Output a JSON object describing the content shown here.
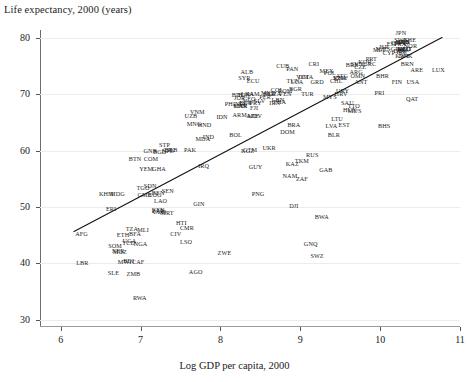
{
  "chart_data": {
    "type": "scatter",
    "title": "Life expectancy, 2000 (years)",
    "xlabel": "Log GDP per capita, 2000",
    "ylabel": "Life expectancy, 2000 (years)",
    "xlim": [
      5.74,
      11.0
    ],
    "ylim": [
      28.9,
      81.4
    ],
    "xticks": [
      6,
      7,
      8,
      9,
      10,
      11
    ],
    "yticks": [
      30,
      40,
      50,
      60,
      70,
      80
    ],
    "xtick_labels": [
      "6",
      "7",
      "8",
      "9",
      "10",
      "11"
    ],
    "ytick_labels": [
      "30",
      "40",
      "50",
      "60",
      "70",
      "80"
    ],
    "grid": "horizontal",
    "legend": null,
    "marker_style": "text-label",
    "fit_line": {
      "type": "linear",
      "x_start": 6.16,
      "y_start": 45.6,
      "x_end": 10.78,
      "y_end": 80.1,
      "slope": 7.47,
      "intercept": -0.41
    },
    "points": [
      {
        "code": "AFG",
        "x": 6.26,
        "y": 45.3
      },
      {
        "code": "AGO",
        "x": 7.69,
        "y": 38.4
      },
      {
        "code": "ALB",
        "x": 8.33,
        "y": 73.9
      },
      {
        "code": "ANT",
        "x": 9.76,
        "y": 72.1
      },
      {
        "code": "ARE",
        "x": 10.46,
        "y": 74.3
      },
      {
        "code": "ARG",
        "x": 9.7,
        "y": 73.9
      },
      {
        "code": "ARM",
        "x": 8.24,
        "y": 66.4
      },
      {
        "code": "ATG",
        "x": 9.52,
        "y": 73.3
      },
      {
        "code": "AUS",
        "x": 10.29,
        "y": 79.2
      },
      {
        "code": "AUT",
        "x": 10.32,
        "y": 78.1
      },
      {
        "code": "AZE",
        "x": 8.4,
        "y": 66.2
      },
      {
        "code": "BDI",
        "x": 6.85,
        "y": 40.4
      },
      {
        "code": "BEL",
        "x": 10.29,
        "y": 77.8
      },
      {
        "code": "BEN",
        "x": 7.22,
        "y": 52.5
      },
      {
        "code": "BFA",
        "x": 6.93,
        "y": 45.2
      },
      {
        "code": "BGD",
        "x": 7.24,
        "y": 59.8
      },
      {
        "code": "BGR",
        "x": 8.94,
        "y": 71.0
      },
      {
        "code": "BHR",
        "x": 10.03,
        "y": 73.2
      },
      {
        "code": "BHS",
        "x": 10.05,
        "y": 64.3
      },
      {
        "code": "BIH",
        "x": 8.21,
        "y": 69.9
      },
      {
        "code": "BLR",
        "x": 9.42,
        "y": 62.7
      },
      {
        "code": "BLZ",
        "x": 8.61,
        "y": 70.0
      },
      {
        "code": "BOL",
        "x": 8.19,
        "y": 62.7
      },
      {
        "code": "BRA",
        "x": 8.92,
        "y": 64.6
      },
      {
        "code": "BRB",
        "x": 9.65,
        "y": 75.2
      },
      {
        "code": "BRN",
        "x": 10.34,
        "y": 75.3
      },
      {
        "code": "BTN",
        "x": 6.93,
        "y": 58.6
      },
      {
        "code": "BWA",
        "x": 9.27,
        "y": 48.3
      },
      {
        "code": "CAF",
        "x": 6.97,
        "y": 40.2
      },
      {
        "code": "CAN",
        "x": 10.29,
        "y": 79.2
      },
      {
        "code": "CHE",
        "x": 10.37,
        "y": 79.7
      },
      {
        "code": "CHL",
        "x": 9.45,
        "y": 72.3
      },
      {
        "code": "CHN",
        "x": 8.25,
        "y": 68.0
      },
      {
        "code": "CIV",
        "x": 7.44,
        "y": 45.3
      },
      {
        "code": "CMR",
        "x": 7.58,
        "y": 46.2
      },
      {
        "code": "COD",
        "x": 7.24,
        "y": 49.1
      },
      {
        "code": "COG",
        "x": 7.18,
        "y": 52.2
      },
      {
        "code": "COL",
        "x": 8.71,
        "y": 70.8
      },
      {
        "code": "COM",
        "x": 7.13,
        "y": 58.5
      },
      {
        "code": "CPV",
        "x": 8.31,
        "y": 68.5
      },
      {
        "code": "CRI",
        "x": 9.17,
        "y": 75.4
      },
      {
        "code": "CUB",
        "x": 8.78,
        "y": 75.0
      },
      {
        "code": "CYP",
        "x": 10.11,
        "y": 77.4
      },
      {
        "code": "CZE",
        "x": 9.75,
        "y": 74.9
      },
      {
        "code": "DEU",
        "x": 10.3,
        "y": 78.0
      },
      {
        "code": "DJI",
        "x": 8.92,
        "y": 50.1
      },
      {
        "code": "DMA",
        "x": 9.07,
        "y": 73.1
      },
      {
        "code": "DNK",
        "x": 10.32,
        "y": 76.8
      },
      {
        "code": "DOM",
        "x": 8.84,
        "y": 63.3
      },
      {
        "code": "DZA",
        "x": 8.68,
        "y": 70.1
      },
      {
        "code": "ECU",
        "x": 8.41,
        "y": 72.3
      },
      {
        "code": "EGY",
        "x": 8.32,
        "y": 68.5
      },
      {
        "code": "ERI",
        "x": 6.63,
        "y": 49.7
      },
      {
        "code": "ESP",
        "x": 10.15,
        "y": 78.9
      },
      {
        "code": "EST",
        "x": 9.55,
        "y": 64.6
      },
      {
        "code": "ETH",
        "x": 6.78,
        "y": 45.1
      },
      {
        "code": "FIN",
        "x": 10.21,
        "y": 72.2
      },
      {
        "code": "FJI",
        "x": 8.42,
        "y": 67.6
      },
      {
        "code": "FRA",
        "x": 10.25,
        "y": 79.0
      },
      {
        "code": "GAB",
        "x": 9.32,
        "y": 56.5
      },
      {
        "code": "GBR",
        "x": 10.25,
        "y": 77.7
      },
      {
        "code": "GEO",
        "x": 8.36,
        "y": 69.2
      },
      {
        "code": "GHA",
        "x": 7.23,
        "y": 56.8
      },
      {
        "code": "GIN",
        "x": 7.73,
        "y": 50.6
      },
      {
        "code": "GMB",
        "x": 7.05,
        "y": 52.2
      },
      {
        "code": "GNB",
        "x": 7.12,
        "y": 59.9
      },
      {
        "code": "GNQ",
        "x": 9.13,
        "y": 43.5
      },
      {
        "code": "GRC",
        "x": 9.87,
        "y": 75.4
      },
      {
        "code": "GRD",
        "x": 9.21,
        "y": 72.1
      },
      {
        "code": "GTM",
        "x": 8.37,
        "y": 60.2
      },
      {
        "code": "GUY",
        "x": 8.44,
        "y": 57.1
      },
      {
        "code": "HKG",
        "x": 10.28,
        "y": 79.2
      },
      {
        "code": "HND",
        "x": 7.8,
        "y": 64.6
      },
      {
        "code": "HRV",
        "x": 9.51,
        "y": 70.1
      },
      {
        "code": "HTI",
        "x": 7.51,
        "y": 47.1
      },
      {
        "code": "HUN",
        "x": 9.62,
        "y": 67.2
      },
      {
        "code": "IDN",
        "x": 8.02,
        "y": 66.0
      },
      {
        "code": "IND",
        "x": 7.85,
        "y": 62.5
      },
      {
        "code": "IRL",
        "x": 10.27,
        "y": 77.5
      },
      {
        "code": "IRN",
        "x": 8.68,
        "y": 68.5
      },
      {
        "code": "IRQ",
        "x": 7.79,
        "y": 57.3
      },
      {
        "code": "ISL",
        "x": 10.31,
        "y": 79.3
      },
      {
        "code": "ISR",
        "x": 10.05,
        "y": 78.4
      },
      {
        "code": "ITA",
        "x": 10.2,
        "y": 79.1
      },
      {
        "code": "JAM",
        "x": 8.41,
        "y": 70.0
      },
      {
        "code": "JOR",
        "x": 8.24,
        "y": 69.4
      },
      {
        "code": "JPN",
        "x": 10.26,
        "y": 80.9
      },
      {
        "code": "KAZ",
        "x": 8.9,
        "y": 57.7
      },
      {
        "code": "KEN",
        "x": 7.22,
        "y": 49.5
      },
      {
        "code": "KGZ",
        "x": 8.34,
        "y": 60.0
      },
      {
        "code": "KHM",
        "x": 6.57,
        "y": 52.4
      },
      {
        "code": "KNA",
        "x": 9.5,
        "y": 72.8
      },
      {
        "code": "KOR",
        "x": 9.81,
        "y": 75.8
      },
      {
        "code": "KWT",
        "x": 10.28,
        "y": 76.7
      },
      {
        "code": "LAO",
        "x": 7.25,
        "y": 51.1
      },
      {
        "code": "LBN",
        "x": 8.72,
        "y": 69.0
      },
      {
        "code": "LBR",
        "x": 6.27,
        "y": 40.1
      },
      {
        "code": "LCA",
        "x": 8.96,
        "y": 72.1
      },
      {
        "code": "LKA",
        "x": 8.34,
        "y": 70.0
      },
      {
        "code": "LSO",
        "x": 7.57,
        "y": 43.8
      },
      {
        "code": "LTU",
        "x": 9.46,
        "y": 65.6
      },
      {
        "code": "LUX",
        "x": 10.73,
        "y": 74.3
      },
      {
        "code": "LVA",
        "x": 9.39,
        "y": 64.4
      },
      {
        "code": "MAR",
        "x": 8.25,
        "y": 68.0
      },
      {
        "code": "MDA",
        "x": 7.78,
        "y": 62.1
      },
      {
        "code": "MDG",
        "x": 6.71,
        "y": 52.4
      },
      {
        "code": "MDV",
        "x": 8.43,
        "y": 66.2
      },
      {
        "code": "MEX",
        "x": 9.33,
        "y": 74.1
      },
      {
        "code": "MKD",
        "x": 8.6,
        "y": 70.2
      },
      {
        "code": "MLI",
        "x": 7.03,
        "y": 45.9
      },
      {
        "code": "MLT",
        "x": 9.99,
        "y": 77.8
      },
      {
        "code": "MNG",
        "x": 7.67,
        "y": 64.8
      },
      {
        "code": "MOZ",
        "x": 6.74,
        "y": 42.1
      },
      {
        "code": "MRT",
        "x": 7.33,
        "y": 48.9
      },
      {
        "code": "MUS",
        "x": 9.68,
        "y": 67.1
      },
      {
        "code": "MWI",
        "x": 6.8,
        "y": 40.2
      },
      {
        "code": "MYS",
        "x": 9.37,
        "y": 69.6
      },
      {
        "code": "NAM",
        "x": 8.87,
        "y": 55.5
      },
      {
        "code": "NER",
        "x": 6.72,
        "y": 42.2
      },
      {
        "code": "NGA",
        "x": 7.0,
        "y": 43.5
      },
      {
        "code": "NIC",
        "x": 8.25,
        "y": 68.2
      },
      {
        "code": "NLD",
        "x": 10.3,
        "y": 78.0
      },
      {
        "code": "NOR",
        "x": 10.38,
        "y": 78.6
      },
      {
        "code": "NPL",
        "x": 7.34,
        "y": 60.0
      },
      {
        "code": "NZL",
        "x": 10.02,
        "y": 78.1
      },
      {
        "code": "OMN",
        "x": 9.72,
        "y": 73.3
      },
      {
        "code": "PAK",
        "x": 7.62,
        "y": 60.1
      },
      {
        "code": "PAN",
        "x": 8.9,
        "y": 74.4
      },
      {
        "code": "PER",
        "x": 8.56,
        "y": 69.5
      },
      {
        "code": "PHL",
        "x": 8.13,
        "y": 68.2
      },
      {
        "code": "PNG",
        "x": 8.47,
        "y": 52.4
      },
      {
        "code": "POL",
        "x": 9.37,
        "y": 73.8
      },
      {
        "code": "PRI",
        "x": 9.99,
        "y": 70.2
      },
      {
        "code": "PRT",
        "x": 9.89,
        "y": 76.2
      },
      {
        "code": "PRY",
        "x": 8.44,
        "y": 68.5
      },
      {
        "code": "QAT",
        "x": 10.4,
        "y": 69.2
      },
      {
        "code": "ROM",
        "x": 8.81,
        "y": 70.5
      },
      {
        "code": "RUS",
        "x": 9.15,
        "y": 59.2
      },
      {
        "code": "RWA",
        "x": 6.99,
        "y": 33.9
      },
      {
        "code": "SAU",
        "x": 9.59,
        "y": 68.5
      },
      {
        "code": "SDN",
        "x": 7.12,
        "y": 53.7
      },
      {
        "code": "SEN",
        "x": 7.34,
        "y": 52.8
      },
      {
        "code": "SGP",
        "x": 10.16,
        "y": 78.0
      },
      {
        "code": "SLB",
        "x": 7.39,
        "y": 60.1
      },
      {
        "code": "SLE",
        "x": 6.66,
        "y": 38.3
      },
      {
        "code": "SLV",
        "x": 8.49,
        "y": 68.8
      },
      {
        "code": "SOM",
        "x": 6.68,
        "y": 43.1
      },
      {
        "code": "STP",
        "x": 7.3,
        "y": 61.0
      },
      {
        "code": "SVK",
        "x": 9.49,
        "y": 72.8
      },
      {
        "code": "SVN",
        "x": 9.71,
        "y": 75.3
      },
      {
        "code": "SWE",
        "x": 10.26,
        "y": 79.6
      },
      {
        "code": "SWZ",
        "x": 9.21,
        "y": 41.3
      },
      {
        "code": "SYR",
        "x": 8.3,
        "y": 72.8
      },
      {
        "code": "TCD",
        "x": 6.85,
        "y": 43.6
      },
      {
        "code": "TGO",
        "x": 7.03,
        "y": 53.3
      },
      {
        "code": "THA",
        "x": 8.74,
        "y": 68.6
      },
      {
        "code": "TJK",
        "x": 7.36,
        "y": 60.2
      },
      {
        "code": "TKM",
        "x": 9.02,
        "y": 58.1
      },
      {
        "code": "TON",
        "x": 8.29,
        "y": 69.8
      },
      {
        "code": "TTO",
        "x": 9.67,
        "y": 68.0
      },
      {
        "code": "TUN",
        "x": 8.91,
        "y": 72.3
      },
      {
        "code": "TUR",
        "x": 9.09,
        "y": 70.0
      },
      {
        "code": "TZA",
        "x": 6.89,
        "y": 46.1
      },
      {
        "code": "UGA",
        "x": 6.86,
        "y": 44.0
      },
      {
        "code": "UKR",
        "x": 8.61,
        "y": 60.4
      },
      {
        "code": "URY",
        "x": 9.53,
        "y": 70.5
      },
      {
        "code": "USA",
        "x": 10.41,
        "y": 72.2
      },
      {
        "code": "UZB",
        "x": 7.63,
        "y": 66.2
      },
      {
        "code": "VCT",
        "x": 9.03,
        "y": 73.0
      },
      {
        "code": "VEN",
        "x": 8.81,
        "y": 70.1
      },
      {
        "code": "VNM",
        "x": 7.71,
        "y": 66.8
      },
      {
        "code": "YEM",
        "x": 7.07,
        "y": 56.8
      },
      {
        "code": "ZAF",
        "x": 9.02,
        "y": 55.0
      },
      {
        "code": "ZAR",
        "x": 7.22,
        "y": 49.3
      },
      {
        "code": "ZMB",
        "x": 6.91,
        "y": 38.2
      },
      {
        "code": "ZWE",
        "x": 8.05,
        "y": 41.8
      }
    ]
  },
  "style": {
    "background": "#ffffff",
    "text_color": "#1c1c1c",
    "axis_color": "#6d6d6d",
    "grid_color": "#ececec",
    "fit_line_color": "#111111"
  }
}
